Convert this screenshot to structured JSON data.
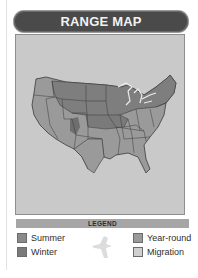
{
  "header": {
    "title": "RANGE MAP"
  },
  "map": {
    "region": "Contiguous United States",
    "colors": {
      "background": "#c9c9c9",
      "summer": "#8a8a8a",
      "winter": "#7a7a7a",
      "year_round": "#9a9a9a",
      "migration": "#c6c6c6",
      "great_lakes_outline": "#ececec"
    }
  },
  "legend": {
    "title": "LEGEND",
    "items": [
      {
        "label": "Summer",
        "color": "#8a8a8a"
      },
      {
        "label": "Winter",
        "color": "#7a7a7a"
      },
      {
        "label": "Year-round",
        "color": "#9a9a9a"
      },
      {
        "label": "Migration",
        "color": "#cfcfcf"
      }
    ],
    "icon": "bird-silhouette-icon"
  }
}
